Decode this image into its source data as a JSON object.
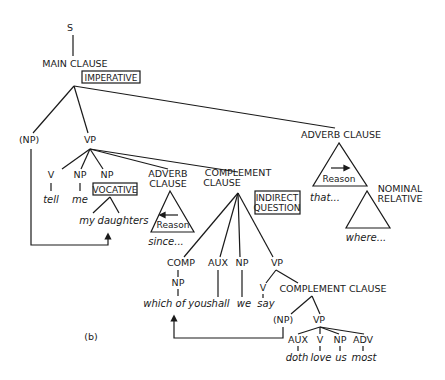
{
  "diagram": {
    "type": "syntax-tree",
    "caption": "(b)",
    "root": "S",
    "nodes": {
      "s": "S",
      "main_clause": "MAIN CLAUSE",
      "imperative": "IMPERATIVE",
      "np_subject": "(NP)",
      "vp_main": "VP",
      "v": "V",
      "np_me": "NP",
      "np_voc": "NP",
      "vocative": "VOCATIVE",
      "adverb_clause_1_line1": "ADVERB",
      "adverb_clause_1_line2": "CLAUSE",
      "reason_1": "Reason",
      "complement_clause_line1": "COMPLEMENT",
      "complement_clause_line2": "CLAUSE",
      "indirect_line1": "INDIRECT",
      "indirect_line2": "QUESTION",
      "adverb_clause_2": "ADVERB CLAUSE",
      "reason_2": "Reason",
      "nominal_line1": "NOMINAL",
      "nominal_line2": "RELATIVE",
      "comp": "COMP",
      "comp_np": "NP",
      "aux": "AUX",
      "np_we": "NP",
      "vp_say": "VP",
      "v_say": "V",
      "complement_clause_2": "COMPLEMENT CLAUSE",
      "np_inner": "(NP)",
      "vp_inner": "VP",
      "aux_inner": "AUX",
      "v_inner": "V",
      "np_us": "NP",
      "adv": "ADV"
    },
    "words": {
      "tell": "tell",
      "me": "me",
      "my": "my",
      "daughters": "daughters",
      "since": "since...",
      "that": "that...",
      "where": "where...",
      "which_of_you": "which of you",
      "shall": "shall",
      "we": "we",
      "say": "say",
      "doth": "doth",
      "love": "love",
      "us": "us",
      "most": "most"
    }
  }
}
